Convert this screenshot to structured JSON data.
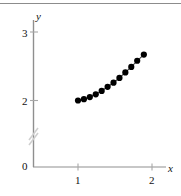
{
  "figure": {
    "background_color": "#ffffff",
    "top_rule_color": "#8c8c8c",
    "axis_color": "#8f8f8f",
    "marker_color": "#000000",
    "line_color": "#444444",
    "break_color": "#cfcfcf"
  },
  "axes": {
    "x_label": "x",
    "y_label": "y",
    "x_ticks": [
      {
        "label": "1",
        "value": 1
      },
      {
        "label": "2",
        "value": 2
      }
    ],
    "y_ticks": [
      {
        "label": "0",
        "value": 0
      },
      {
        "label": "2",
        "value": 2
      },
      {
        "label": "3",
        "value": 3
      }
    ],
    "y_axis_break": true
  },
  "chart_data": {
    "type": "scatter",
    "title": "",
    "xlabel": "x",
    "ylabel": "y",
    "grid": false,
    "legend": null,
    "xlim": [
      0.72,
      2.18
    ],
    "ylim": [
      1.93,
      3.12
    ],
    "x": [
      1.0,
      1.08,
      1.16,
      1.24,
      1.32,
      1.4,
      1.48,
      1.56,
      1.64,
      1.72,
      1.8,
      1.89
    ],
    "y": [
      2.0,
      2.02,
      2.05,
      2.09,
      2.14,
      2.2,
      2.26,
      2.33,
      2.41,
      2.49,
      2.58,
      2.67
    ],
    "marker": "filled-circle",
    "marker_color": "#000000",
    "connected": true
  }
}
